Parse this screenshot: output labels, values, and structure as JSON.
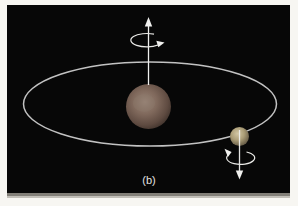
{
  "figure": {
    "caption_label": "(b)",
    "colors": {
      "page_bg": "#f7f6f2",
      "panel_bg": "#070707",
      "orbit": "#c2c2c2",
      "arrow": "#f0f0ee",
      "planet_mid": "#80695c",
      "moon_mid": "#ab9d77",
      "shadow_edge": "#827f78"
    },
    "elements": {
      "orbit": "orbital-path",
      "planet": "central-planet",
      "planet_spin": "planet-spin-axis-arrow-up",
      "planet_spin_direction": "planet-spin-direction-arrow",
      "moon": "orbiting-moon",
      "moon_spin": "moon-spin-axis-arrow-down",
      "moon_spin_direction": "moon-spin-direction-arrow"
    }
  }
}
